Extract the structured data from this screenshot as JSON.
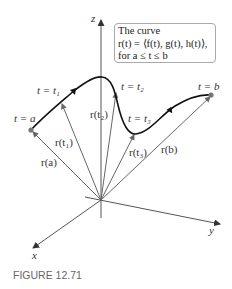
{
  "figure": {
    "caption": "FIGURE 12.71",
    "axes": {
      "z": "z",
      "x": "x",
      "y": "y"
    },
    "infobox": {
      "line1": "The curve",
      "line2": "r(t) = ⟨f(t), g(t), h(t)⟩,",
      "line3": "for a ≤ t ≤ b"
    },
    "curve_labels": {
      "t_a": "t = a",
      "t_1": "t = t₁",
      "t_2": "t = t₂",
      "t_3": "t = t₃",
      "t_b": "t = b"
    },
    "vector_labels": {
      "r_a": "r(a)",
      "r_t1": "r(t₁)",
      "r_t2": "r(t₂)",
      "r_t3": "r(t₃)",
      "r_b": "r(b)"
    },
    "colors": {
      "curve": "#111111",
      "vectors": "#666666",
      "axes": "#555555",
      "point": "#777777",
      "caption": "#6b6b6b"
    }
  }
}
